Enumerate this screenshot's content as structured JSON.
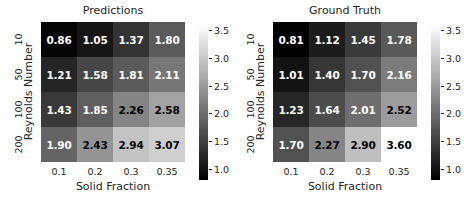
{
  "figure": {
    "width": 464,
    "height": 204,
    "background": "#ffffff"
  },
  "chart_data": [
    {
      "type": "heatmap",
      "title": "Predictions",
      "xlabel": "Solid Fraction",
      "ylabel": "Reynolds Number",
      "xticklabels": [
        "0.1",
        "0.2",
        "0.3",
        "0.35"
      ],
      "yticklabels": [
        "10",
        "50",
        "100",
        "200"
      ],
      "x": [
        0.1,
        0.2,
        0.3,
        0.35
      ],
      "y": [
        10,
        50,
        100,
        200
      ],
      "values": [
        [
          0.86,
          1.05,
          1.37,
          1.8
        ],
        [
          1.21,
          1.58,
          1.81,
          2.11
        ],
        [
          1.43,
          1.85,
          2.26,
          2.58
        ],
        [
          1.9,
          2.43,
          2.94,
          3.07
        ]
      ],
      "annotations": [
        [
          "0.86",
          "1.05",
          "1.37",
          "1.80"
        ],
        [
          "1.21",
          "1.58",
          "1.81",
          "2.11"
        ],
        [
          "1.43",
          "1.85",
          "2.26",
          "2.58"
        ],
        [
          "1.90",
          "2.43",
          "2.94",
          "3.07"
        ]
      ],
      "cmap": "gray",
      "vmin": 0.81,
      "vmax": 3.6,
      "grid": false,
      "colorbar": {
        "ticks": [
          "1.0",
          "1.5",
          "2.0",
          "2.5",
          "3.0",
          "3.5"
        ],
        "tickvalues": [
          1.0,
          1.5,
          2.0,
          2.5,
          3.0,
          3.5
        ],
        "position": "right",
        "orientation": "vertical"
      }
    },
    {
      "type": "heatmap",
      "title": "Ground Truth",
      "xlabel": "Solid Fraction",
      "ylabel": "Reynolds Number",
      "xticklabels": [
        "0.1",
        "0.2",
        "0.3",
        "0.35"
      ],
      "yticklabels": [
        "10",
        "50",
        "100",
        "200"
      ],
      "x": [
        0.1,
        0.2,
        0.3,
        0.35
      ],
      "y": [
        10,
        50,
        100,
        200
      ],
      "values": [
        [
          0.81,
          1.12,
          1.45,
          1.78
        ],
        [
          1.01,
          1.4,
          1.7,
          2.16
        ],
        [
          1.23,
          1.64,
          2.01,
          2.52
        ],
        [
          1.7,
          2.27,
          2.9,
          3.6
        ]
      ],
      "annotations": [
        [
          "0.81",
          "1.12",
          "1.45",
          "1.78"
        ],
        [
          "1.01",
          "1.40",
          "1.70",
          "2.16"
        ],
        [
          "1.23",
          "1.64",
          "2.01",
          "2.52"
        ],
        [
          "1.70",
          "2.27",
          "2.90",
          "3.60"
        ]
      ],
      "cmap": "gray",
      "vmin": 0.81,
      "vmax": 3.6,
      "grid": false,
      "colorbar": {
        "ticks": [
          "1.0",
          "1.5",
          "2.0",
          "2.5",
          "3.0",
          "3.5"
        ],
        "tickvalues": [
          1.0,
          1.5,
          2.0,
          2.5,
          3.0,
          3.5
        ],
        "position": "right",
        "orientation": "vertical"
      }
    }
  ]
}
